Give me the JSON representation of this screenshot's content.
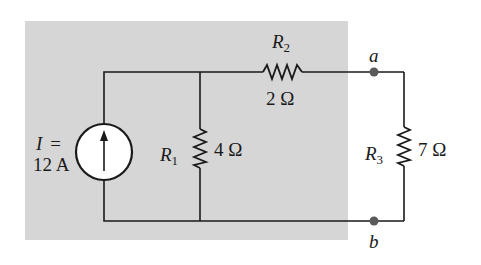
{
  "diagram": {
    "type": "circuit",
    "colors": {
      "shade": "#d6d6d6",
      "wire": "#1a1a1a",
      "node": "#5a5a5a"
    },
    "source": {
      "symbol": "I",
      "eq": "=",
      "value": "12 A",
      "direction": "up"
    },
    "resistors": [
      {
        "name": "R",
        "sub": "1",
        "value": "4 Ω",
        "orientation": "vertical"
      },
      {
        "name": "R",
        "sub": "2",
        "value": "2 Ω",
        "orientation": "horizontal"
      },
      {
        "name": "R",
        "sub": "3",
        "value": "7 Ω",
        "orientation": "vertical"
      }
    ],
    "nodes": [
      {
        "label": "a"
      },
      {
        "label": "b"
      }
    ]
  }
}
